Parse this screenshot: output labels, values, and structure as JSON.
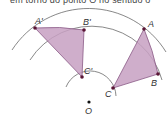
{
  "caption": "em torno do ponto O no sentido o",
  "colors": {
    "fill": "#c7a0c2",
    "edge": "#8a5a86",
    "point": "#5a1535",
    "arc": "#555555",
    "center": "#111111"
  },
  "labels": {
    "A_prime": "A'",
    "B_prime": "B'",
    "C_prime": "C'",
    "A": "A",
    "B": "B",
    "C": "C",
    "O": "O"
  },
  "points": {
    "A_prime": [
      35,
      28
    ],
    "B_prime": [
      84,
      30
    ],
    "C_prime": [
      82,
      77
    ],
    "A": [
      144,
      29
    ],
    "B": [
      158,
      74
    ],
    "C": [
      113,
      88
    ],
    "O": [
      89,
      102
    ]
  },
  "arcs": [
    {
      "name": "inner",
      "radius": 26
    },
    {
      "name": "middle",
      "radius": 73
    },
    {
      "name": "outer",
      "radius": 91
    }
  ]
}
